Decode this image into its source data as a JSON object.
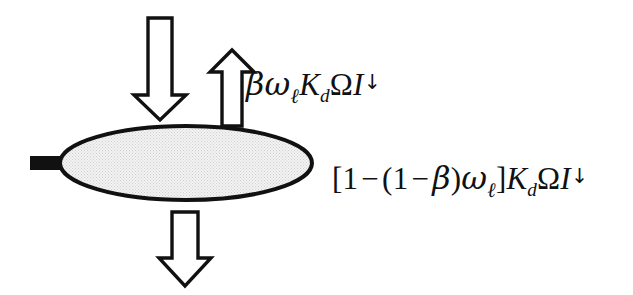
{
  "figure": {
    "background_color": "#ffffff",
    "width": 633,
    "height": 295
  },
  "leaf": {
    "name": "leaf-ellipse",
    "fill_color": "#ebebeb",
    "outline_color": "#111111",
    "outline_width": 4,
    "center_x": 186,
    "center_y": 163,
    "radius_x": 126,
    "radius_y": 37,
    "petiole": {
      "name": "leaf-petiole",
      "color": "#111111",
      "x": 30,
      "y": 156,
      "width": 32,
      "height": 14
    }
  },
  "arrows": [
    {
      "id": "incoming-radiation-arrow",
      "direction": "down",
      "label": "incident beam flux",
      "stroke_color": "#111111",
      "fill_color": "#ffffff"
    },
    {
      "id": "reflected-radiation-arrow",
      "direction": "up",
      "label": "reflected/scattered flux",
      "stroke_color": "#111111",
      "fill_color": "#ffffff"
    },
    {
      "id": "transmitted-radiation-arrow",
      "direction": "down",
      "label": "transmitted flux",
      "stroke_color": "#111111",
      "fill_color": "#ffffff"
    }
  ],
  "formulas": {
    "absorbed": {
      "id": "formula-absorbed",
      "plain_text": "βωℓK_dΩI↓",
      "tokens": {
        "beta": "β",
        "omega": "ω",
        "omega_sub": "ℓ",
        "k": "K",
        "k_sub": "d",
        "capital_omega": "Ω",
        "i": "I",
        "i_sup": "↓"
      }
    },
    "transmitted": {
      "id": "formula-transmitted",
      "plain_text": "[1 − (1 − β)ωℓ]K_dΩI↓",
      "tokens": {
        "bracket_open": "[",
        "one_a": "1",
        "minus_a": "−",
        "paren_open": "(",
        "one_b": "1",
        "minus_b": "−",
        "beta": "β",
        "paren_close": ")",
        "omega": "ω",
        "omega_sub": "ℓ",
        "bracket_close": "]",
        "k": "K",
        "k_sub": "d",
        "capital_omega": "Ω",
        "i": "I",
        "i_sup": "↓"
      }
    }
  }
}
